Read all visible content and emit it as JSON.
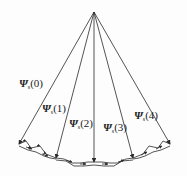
{
  "diagram": {
    "type": "fan-of-vectors",
    "apex": [
      94,
      12
    ],
    "line_color": "#2a2a2a",
    "vectors": [
      {
        "id": "psi0",
        "symbol": "Ψ",
        "subscript": "s",
        "arg": "(0)",
        "end": [
          19,
          144
        ],
        "label_pos": [
          19,
          83
        ]
      },
      {
        "id": "psi1",
        "symbol": "Ψ",
        "subscript": "s",
        "arg": "(1)",
        "end": [
          56,
          158
        ],
        "label_pos": [
          42,
          108
        ]
      },
      {
        "id": "psi2",
        "symbol": "Ψ",
        "subscript": "s",
        "arg": "(2)",
        "end": [
          94,
          162
        ],
        "label_pos": [
          69,
          123
        ]
      },
      {
        "id": "psi3",
        "symbol": "Ψ",
        "subscript": "s",
        "arg": "(3)",
        "end": [
          133,
          158
        ],
        "label_pos": [
          103,
          127
        ]
      },
      {
        "id": "psi4",
        "symbol": "Ψ",
        "subscript": "s",
        "arg": "(4)",
        "end": [
          170,
          144
        ],
        "label_pos": [
          134,
          115
        ]
      }
    ],
    "trajectory": "stepped zig-zag boundary with small arrows connecting vector tips"
  }
}
